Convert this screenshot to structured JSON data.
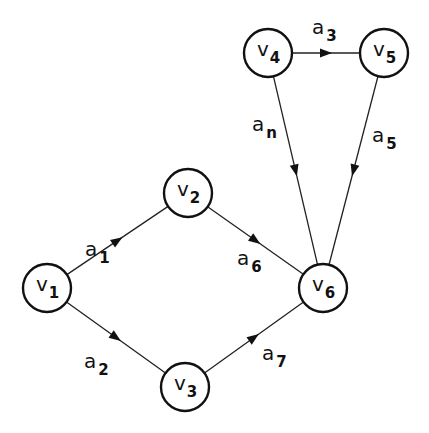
{
  "diagram": {
    "type": "directed-graph",
    "nodes": [
      {
        "id": "v1",
        "label": "v",
        "sub": "1",
        "x": 47,
        "y": 288
      },
      {
        "id": "v2",
        "label": "v",
        "sub": "2",
        "x": 188,
        "y": 193
      },
      {
        "id": "v3",
        "label": "v",
        "sub": "3",
        "x": 185,
        "y": 387
      },
      {
        "id": "v4",
        "label": "v",
        "sub": "4",
        "x": 268,
        "y": 53
      },
      {
        "id": "v5",
        "label": "v",
        "sub": "5",
        "x": 384,
        "y": 53
      },
      {
        "id": "v6",
        "label": "v",
        "sub": "6",
        "x": 323,
        "y": 288
      }
    ],
    "edges": [
      {
        "id": "a1",
        "label": "a",
        "sub": "1",
        "from": "v1",
        "to": "v2",
        "lx": 85,
        "ly": 238
      },
      {
        "id": "a2",
        "label": "a",
        "sub": "2",
        "from": "v1",
        "to": "v3",
        "lx": 84,
        "ly": 350
      },
      {
        "id": "a3",
        "label": "a",
        "sub": "3",
        "from": "v4",
        "to": "v5",
        "lx": 312,
        "ly": 16
      },
      {
        "id": "an",
        "label": "a",
        "sub": "n",
        "from": "v4",
        "to": "v6",
        "lx": 252,
        "ly": 113
      },
      {
        "id": "a5",
        "label": "a",
        "sub": "5",
        "from": "v5",
        "to": "v6",
        "lx": 372,
        "ly": 124
      },
      {
        "id": "a6",
        "label": "a",
        "sub": "6",
        "from": "v2",
        "to": "v6",
        "lx": 237,
        "ly": 247
      },
      {
        "id": "a7",
        "label": "a",
        "sub": "7",
        "from": "v3",
        "to": "v6",
        "lx": 262,
        "ly": 342
      }
    ],
    "node_radius": 24,
    "colors": {
      "stroke": "#111111",
      "background": "#ffffff"
    }
  }
}
